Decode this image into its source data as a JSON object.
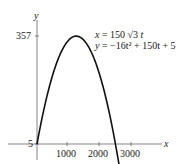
{
  "chart_data": {
    "type": "line",
    "title": "",
    "xlabel": "x",
    "ylabel": "y",
    "equations": {
      "x_eq": "x = 150 √3 t",
      "y_eq": "y = −16t² + 150t + 5"
    },
    "x_ticks": [
      "1000",
      "2000",
      "3000"
    ],
    "x_tick_values": [
      1000,
      2000,
      3000
    ],
    "y_ticks": [
      "5",
      "357"
    ],
    "y_tick_values": [
      5,
      357
    ],
    "xlim": [
      0,
      3300
    ],
    "ylim": [
      -50,
      400
    ],
    "grid": false,
    "legend": null,
    "series": [
      {
        "name": "projectile path",
        "parametric": true,
        "x_formula": "150*sqrt(3)*t",
        "y_formula": "-16*t^2 + 150*t + 5",
        "points": [
          {
            "x": 0,
            "y": 5
          },
          {
            "x": 260,
            "y": 137
          },
          {
            "x": 520,
            "y": 232
          },
          {
            "x": 779,
            "y": 298
          },
          {
            "x": 1039,
            "y": 347
          },
          {
            "x": 1218,
            "y": 357
          },
          {
            "x": 1400,
            "y": 352
          },
          {
            "x": 1818,
            "y": 322
          },
          {
            "x": 2078,
            "y": 271
          },
          {
            "x": 2338,
            "y": 202
          },
          {
            "x": 2510,
            "y": 5
          },
          {
            "x": 2600,
            "y": -55
          }
        ]
      }
    ],
    "annotations": [
      "max height 357",
      "initial height 5"
    ]
  },
  "labels": {
    "x_axis": "x",
    "y_axis": "y",
    "tick_357": "357",
    "tick_5": "5",
    "tick_1000": "1000",
    "tick_2000": "2000",
    "tick_3000": "3000",
    "eq_x_lhs": "x",
    "eq_x_rhs": " = 150 √3 ",
    "eq_x_t": "t",
    "eq_y_lhs": "y",
    "eq_y_rhs": " = −16t² + 150t + 5"
  },
  "colors": {
    "curve": "#111111",
    "axis": "#555555",
    "text": "#222222"
  }
}
